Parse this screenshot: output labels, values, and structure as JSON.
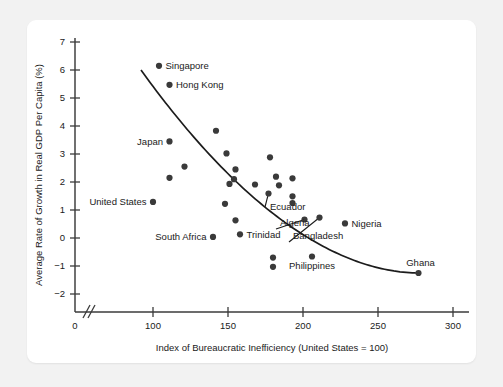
{
  "figure": {
    "background_color": "#f2f2f2",
    "panel_color": "#ffffff",
    "point_color": "#3a3a3a",
    "curve_color": "#1c1c1c",
    "axis_color": "#3b3b3b"
  },
  "chart_data": {
    "type": "scatter",
    "title": "",
    "xlabel": "Index of Bureaucratic Inefficiency (United States = 100)",
    "ylabel": "Average Rate of Growth in Real GDP Per Capita (%)",
    "xlim": [
      0,
      300
    ],
    "ylim": [
      -2,
      7
    ],
    "xticks": [
      0,
      100,
      150,
      200,
      250,
      300
    ],
    "yticks": [
      -2,
      -1,
      0,
      1,
      2,
      3,
      4,
      5,
      6,
      7
    ],
    "xtick_labels": [
      "0",
      "100",
      "150",
      "200",
      "250",
      "300"
    ],
    "ytick_labels": [
      "−2",
      "−1",
      "0",
      "1",
      "2",
      "3",
      "4",
      "5",
      "6",
      "7"
    ],
    "grid": false,
    "axis_break_after_zero": true,
    "legend": null,
    "trend_line": {
      "description": "downward-sloping convex fitted curve",
      "x_start": 92,
      "x_end": 277,
      "y_start": 6.0,
      "y_end": -1.25
    },
    "points": [
      {
        "label": "Singapore",
        "x": 104,
        "y": 6.15,
        "label_pos": "right"
      },
      {
        "label": "Hong Kong",
        "x": 111,
        "y": 5.47,
        "label_pos": "right"
      },
      {
        "label": "Japan",
        "x": 111,
        "y": 3.45,
        "label_pos": "left"
      },
      {
        "label": "United States",
        "x": 100,
        "y": 1.29,
        "label_pos": "left"
      },
      {
        "label": "South Africa",
        "x": 140,
        "y": 0.04,
        "label_pos": "left"
      },
      {
        "label": "Trinidad",
        "x": 158,
        "y": 0.13,
        "label_pos": "right"
      },
      {
        "label": "Ecuador",
        "x": 177,
        "y": 1.59,
        "label_pos": "leader"
      },
      {
        "label": "Algeria",
        "x": 201,
        "y": 0.66,
        "label_pos": "leader"
      },
      {
        "label": "Bangladesh",
        "x": 211,
        "y": 0.73,
        "label_pos": "leader"
      },
      {
        "label": "Nigeria",
        "x": 228,
        "y": 0.52,
        "label_pos": "right"
      },
      {
        "label": "Philippines",
        "x": 206,
        "y": -0.66,
        "label_pos": "below"
      },
      {
        "label": "Ghana",
        "x": 277,
        "y": -1.25,
        "label_pos": "above"
      },
      {
        "label": "",
        "x": 142,
        "y": 3.83,
        "label_pos": "none"
      },
      {
        "label": "",
        "x": 121,
        "y": 2.55,
        "label_pos": "none"
      },
      {
        "label": "",
        "x": 111,
        "y": 2.15,
        "label_pos": "none"
      },
      {
        "label": "",
        "x": 149,
        "y": 3.02,
        "label_pos": "none"
      },
      {
        "label": "",
        "x": 155,
        "y": 2.45,
        "label_pos": "none"
      },
      {
        "label": "",
        "x": 154,
        "y": 2.1,
        "label_pos": "none"
      },
      {
        "label": "",
        "x": 151,
        "y": 1.93,
        "label_pos": "none"
      },
      {
        "label": "",
        "x": 168,
        "y": 1.91,
        "label_pos": "none"
      },
      {
        "label": "",
        "x": 178,
        "y": 2.88,
        "label_pos": "none"
      },
      {
        "label": "",
        "x": 182,
        "y": 2.19,
        "label_pos": "none"
      },
      {
        "label": "",
        "x": 193,
        "y": 2.13,
        "label_pos": "none"
      },
      {
        "label": "",
        "x": 184,
        "y": 1.88,
        "label_pos": "none"
      },
      {
        "label": "",
        "x": 193,
        "y": 1.49,
        "label_pos": "none"
      },
      {
        "label": "",
        "x": 193,
        "y": 1.25,
        "label_pos": "none"
      },
      {
        "label": "",
        "x": 148,
        "y": 1.22,
        "label_pos": "none"
      },
      {
        "label": "",
        "x": 155,
        "y": 0.63,
        "label_pos": "none"
      },
      {
        "label": "",
        "x": 180,
        "y": -0.7,
        "label_pos": "none"
      },
      {
        "label": "",
        "x": 180,
        "y": -1.03,
        "label_pos": "none"
      }
    ]
  }
}
